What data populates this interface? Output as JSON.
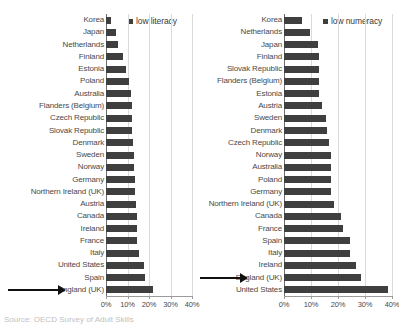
{
  "chart_data": [
    {
      "type": "bar",
      "orientation": "horizontal",
      "title": "",
      "legend": {
        "label": "low literacy",
        "position": "top-right",
        "swatch_color": "#3f3f3f"
      },
      "xlabel": "",
      "ylabel": "",
      "xlim": [
        0,
        40
      ],
      "xticks": [
        0,
        10,
        20,
        30,
        40
      ],
      "xtick_labels": [
        "0%",
        "10%",
        "20%",
        "30%",
        "40%"
      ],
      "grid": true,
      "highlight": {
        "category": "England (UK)",
        "marker": "arrow"
      },
      "categories": [
        "Korea",
        "Japan",
        "Netherlands",
        "Finland",
        "Estonia",
        "Poland",
        "Australia",
        "Flanders (Belgium)",
        "Czech Republic",
        "Slovak Republic",
        "Denmark",
        "Sweden",
        "Norway",
        "Germany",
        "Northern Ireland (UK)",
        "Austria",
        "Canada",
        "Ireland",
        "France",
        "Italy",
        "United States",
        "Spain",
        "England (UK)"
      ],
      "values": [
        2.5,
        4.5,
        5.5,
        8.0,
        9.5,
        10.5,
        11.5,
        12.0,
        12.0,
        12.0,
        12.5,
        13.0,
        13.0,
        13.5,
        13.5,
        14.0,
        14.5,
        14.5,
        14.5,
        15.5,
        17.5,
        18.0,
        22.0
      ]
    },
    {
      "type": "bar",
      "orientation": "horizontal",
      "title": "",
      "legend": {
        "label": "low numeracy",
        "position": "top-right",
        "swatch_color": "#3f3f3f"
      },
      "xlabel": "",
      "ylabel": "",
      "xlim": [
        0,
        40
      ],
      "xticks": [
        0,
        10,
        20,
        30,
        40
      ],
      "xtick_labels": [
        "0%",
        "10%",
        "20%",
        "30%",
        "40%"
      ],
      "grid": true,
      "highlight": {
        "category": "England (UK)",
        "marker": "arrow"
      },
      "categories": [
        "Korea",
        "Netherlands",
        "Japan",
        "Finland",
        "Slovak Republic",
        "Flanders (Belgium)",
        "Estonia",
        "Austria",
        "Sweden",
        "Denmark",
        "Czech Republic",
        "Norway",
        "Australia",
        "Poland",
        "Germany",
        "Northern Ireland (UK)",
        "Canada",
        "France",
        "Spain",
        "Italy",
        "Ireland",
        "England (UK)",
        "United States"
      ],
      "values": [
        6.5,
        9.5,
        12.5,
        13.0,
        13.0,
        13.0,
        13.0,
        14.0,
        15.5,
        16.0,
        16.5,
        17.5,
        17.5,
        17.5,
        17.5,
        18.5,
        21.0,
        22.0,
        24.5,
        24.5,
        26.5,
        28.5,
        38.5
      ]
    }
  ],
  "caption": "Source: OECD Survey of Adult Skills"
}
